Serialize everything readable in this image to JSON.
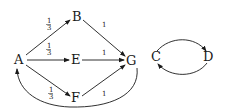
{
  "diagram": {
    "type": "directed-graph",
    "colors": {
      "stroke": "#1a1a1a",
      "background": "#ffffff"
    },
    "nodes": {
      "A": {
        "label": "A",
        "x": 20,
        "y": 64
      },
      "B": {
        "label": "B",
        "x": 77,
        "y": 21
      },
      "E": {
        "label": "E",
        "x": 76,
        "y": 64
      },
      "F": {
        "label": "F",
        "x": 76,
        "y": 102
      },
      "G": {
        "label": "G",
        "x": 131,
        "y": 65
      },
      "C": {
        "label": "C",
        "x": 156,
        "y": 61
      },
      "D": {
        "label": "D",
        "x": 208,
        "y": 61
      }
    },
    "edges": [
      {
        "from": "A",
        "to": "B",
        "weight_num": "1",
        "weight_den": "3"
      },
      {
        "from": "A",
        "to": "E",
        "weight_num": "1",
        "weight_den": "3"
      },
      {
        "from": "A",
        "to": "F",
        "weight_num": "1",
        "weight_den": "3"
      },
      {
        "from": "B",
        "to": "G",
        "weight": "1"
      },
      {
        "from": "E",
        "to": "G",
        "weight": "1"
      },
      {
        "from": "F",
        "to": "G",
        "weight": "1"
      },
      {
        "from": "G",
        "to": "A",
        "weight": ""
      },
      {
        "from": "C",
        "to": "D",
        "weight": ""
      },
      {
        "from": "D",
        "to": "C",
        "weight": ""
      }
    ]
  }
}
